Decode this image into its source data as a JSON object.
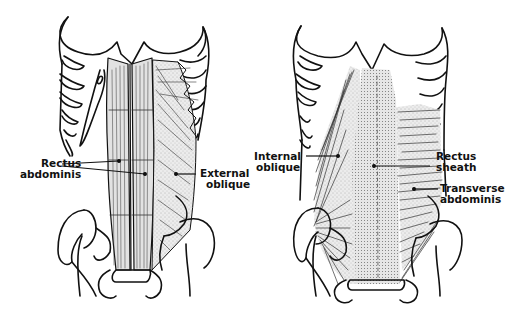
{
  "figure": {
    "panels": [
      {
        "id": "left",
        "description": "Superficial layer",
        "labels": [
          {
            "line1": "Rectus",
            "line2": "abdominis"
          },
          {
            "line1": "External",
            "line2": "oblique"
          }
        ]
      },
      {
        "id": "right",
        "description": "Deep layer",
        "labels": [
          {
            "line1": "Internal",
            "line2": "oblique"
          },
          {
            "line1": "Rectus",
            "line2": "sheath"
          },
          {
            "line1": "Transverse",
            "line2": "abdominis"
          }
        ]
      }
    ],
    "colors": {
      "ink": "#111111",
      "muscle_fill": "#e4e4e4",
      "sheath_fill": "#d9d9d9",
      "background": "#ffffff"
    }
  }
}
